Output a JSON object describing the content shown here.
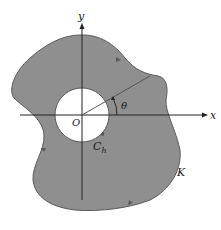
{
  "diagram": {
    "labels": {
      "x_axis": "x",
      "y_axis": "y",
      "origin": "O",
      "angle": "θ",
      "inner_contour": "C",
      "inner_contour_sub": "h",
      "outer_contour": "K"
    },
    "colors": {
      "region_fill": "#8f8f8f",
      "region_stroke": "#5a5a5a",
      "axis": "#222222",
      "hole": "#ffffff",
      "background": "#ffffff"
    }
  }
}
